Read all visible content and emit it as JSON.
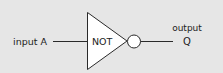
{
  "diagram": {
    "gate_type": "NOT",
    "input_label": "input A",
    "output_label_line1": "output",
    "output_label_line2": "Q",
    "colors": {
      "background": "#e6e6e6",
      "gate_fill": "#ffffff",
      "stroke": "#2a2a2a",
      "text": "#222222"
    }
  }
}
